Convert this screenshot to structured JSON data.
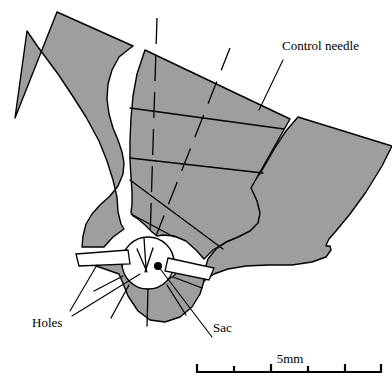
{
  "figure": {
    "colors": {
      "metal_gray": "#9e9e9e",
      "outline_black": "#000000",
      "cavity_white": "#ffffff",
      "background": "#ffffff"
    }
  },
  "labels": {
    "control_needle": "Control needle",
    "holes": "Holes",
    "sac": "Sac"
  },
  "scale_bar": {
    "label": "5mm",
    "total_length_mm": 5,
    "divisions": 5,
    "tick_count": 6,
    "x_start_px": 196,
    "x_end_px": 382,
    "y_px": 372
  },
  "annotations": {
    "sac_marker": "filled-dot",
    "hole_leader_count": 2,
    "needle_leader_count": 1
  }
}
